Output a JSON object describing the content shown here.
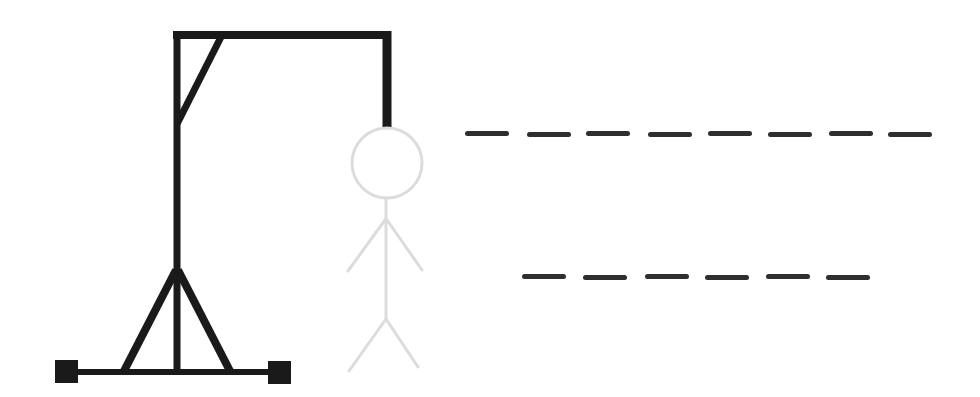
{
  "game": {
    "name": "Hangman",
    "gallows_color": "#1a1a1a",
    "figure_color": "#dcdcdc",
    "dash_color": "#2e2e2e",
    "wrong_guesses_drawn": [
      "head",
      "body",
      "left-arm",
      "right-arm",
      "left-leg",
      "right-leg"
    ]
  },
  "word": {
    "rows": [
      {
        "letters": [
          "",
          "",
          "",
          "",
          "",
          "",
          "",
          ""
        ],
        "top": 131,
        "x": [
          465,
          527,
          586,
          648,
          708,
          768,
          829,
          888
        ],
        "width": 44
      },
      {
        "letters": [
          "",
          "",
          "",
          "",
          "",
          ""
        ],
        "top": 274,
        "x": [
          522,
          583,
          645,
          705,
          766,
          826
        ],
        "width": 44
      }
    ]
  }
}
